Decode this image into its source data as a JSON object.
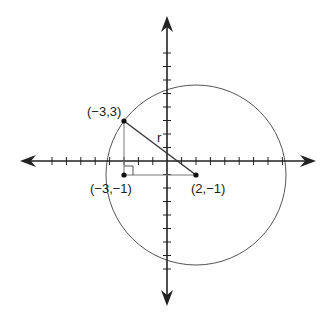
{
  "diagram": {
    "type": "coordinate-plane-circle",
    "colors": {
      "ink": "#222222",
      "circle": "#555555",
      "guide": "#777777",
      "background": "#ffffff"
    },
    "axes": {
      "x_ticks_left": 7,
      "x_ticks_right": 8,
      "y_ticks_up": 8,
      "y_ticks_down": 8
    },
    "points": [
      {
        "id": "p1",
        "label": "(−3,3)",
        "x": -3,
        "y": 3
      },
      {
        "id": "p2",
        "label": "(−3,−1)",
        "x": -3,
        "y": -1
      },
      {
        "id": "p3",
        "label": "(2,−1)",
        "x": 2,
        "y": -1
      }
    ],
    "circle": {
      "center": "(2,−1)",
      "passes_through": "(−3,3)"
    },
    "radius_label": "r",
    "right_angle_at": "(−3,−1)"
  }
}
